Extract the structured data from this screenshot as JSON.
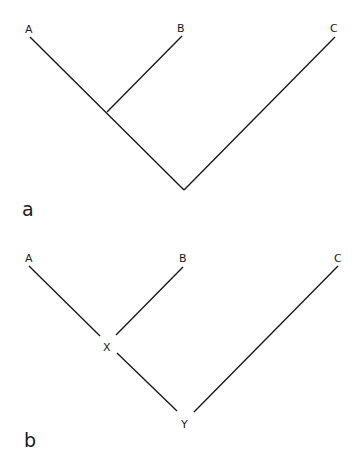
{
  "panels": [
    {
      "label": "a",
      "taxa": [
        "A",
        "B",
        "C"
      ],
      "description": "Cladogram with ((A,B),C); unlabeled internal nodes"
    },
    {
      "label": "b",
      "taxa": [
        "A",
        "B",
        "C"
      ],
      "internal_nodes": [
        "X",
        "Y"
      ],
      "description": "Tree ((A,B)X,C)Y with labeled internal nodes"
    }
  ]
}
